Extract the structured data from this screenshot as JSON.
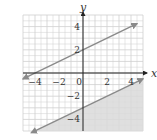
{
  "chart_data": {
    "type": "line",
    "title": "",
    "xlabel": "x",
    "ylabel": "y",
    "xlim": [
      -5,
      5
    ],
    "ylim": [
      -5,
      5
    ],
    "grid": true,
    "x_ticks": [
      "-4",
      "-2",
      "0",
      "2",
      "4"
    ],
    "y_ticks": [
      "4",
      "2",
      "-2",
      "-4"
    ],
    "series": [
      {
        "name": "upper boundary",
        "equation": "y = x/2 + 2",
        "style": "solid",
        "points": [
          [
            -5,
            -0.5
          ],
          [
            4.5,
            4.25
          ]
        ],
        "shaded": "none"
      },
      {
        "name": "lower boundary",
        "equation": "y = x/2 - 3",
        "style": "solid",
        "points": [
          [
            -4.3,
            -5.15
          ],
          [
            5,
            -0.5
          ]
        ],
        "shaded": "below"
      }
    ],
    "colors": {
      "line": "#8a8a8a",
      "shade": "#d9d9d9",
      "grid": "#cfcfcf",
      "axis": "#222222"
    }
  },
  "labels": {
    "x_axis": "x",
    "y_axis": "y",
    "x_ticks": [
      {
        "text": "-4",
        "val": -4
      },
      {
        "text": "-2",
        "val": -2
      },
      {
        "text": "0",
        "val": 0
      },
      {
        "text": "2",
        "val": 2
      },
      {
        "text": "4",
        "val": 4
      }
    ],
    "y_ticks": [
      {
        "text": "4",
        "val": 4
      },
      {
        "text": "2",
        "val": 2
      },
      {
        "text": "-2",
        "val": -2
      },
      {
        "text": "-4",
        "val": -4
      }
    ]
  }
}
